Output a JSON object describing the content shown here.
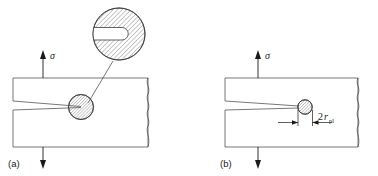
{
  "figure": {
    "background_color": "#ffffff",
    "line_color": "#3c3c3c",
    "text_color": "#1a1a1a",
    "hatch_color": "#6e6e6e"
  },
  "panels": [
    {
      "id": "a",
      "caption": "(a)",
      "stress_label": "σ",
      "description": "Cracked plate under tension with magnified blunted crack tip inset",
      "has_inset": true,
      "inset": {
        "name": "magnified-crack-tip",
        "shape": "hatched-circle",
        "feature": "blunted crack tip notch"
      },
      "crack_tip_zone": {
        "name": "plastic-zone-circle",
        "shape": "hatched-circle"
      }
    },
    {
      "id": "b",
      "caption": "(b)",
      "stress_label": "σ",
      "description": "Cracked plate under tension with plastic zone diameter dimension",
      "has_inset": false,
      "dimension": {
        "prefix": "2",
        "symbol": "r",
        "subscript": "pl",
        "full_label": "2r_pl",
        "meaning": "plastic zone diameter"
      },
      "crack_tip_zone": {
        "name": "plastic-zone-circle",
        "shape": "hatched-circle"
      }
    }
  ]
}
